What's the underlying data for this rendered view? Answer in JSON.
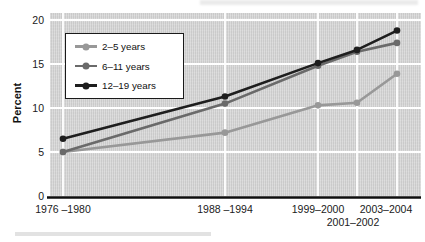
{
  "colors": {
    "plot_background": "#d4d4d4",
    "gridline": "#ffffff",
    "axis_line": "#0d0d0d",
    "text": "#1a1a1a",
    "legend_border": "#1a1a1a"
  },
  "chart_data": {
    "type": "line",
    "title": "",
    "xlabel": "",
    "ylabel": "Percent",
    "ylim": [
      0,
      20
    ],
    "yticks": [
      0,
      5,
      10,
      15,
      20
    ],
    "grid": true,
    "legend_position": "upper-left-inside",
    "categories": [
      "1976 –1980",
      "1988 –1994",
      "1999–2000",
      "2001–2002",
      "2003–2004"
    ],
    "series": [
      {
        "name": "2–5 years",
        "color": "#989898",
        "values": [
          5.0,
          7.2,
          10.3,
          10.6,
          13.9
        ]
      },
      {
        "name": "6–11 years",
        "color": "#6a6a6a",
        "values": [
          5.0,
          10.5,
          14.8,
          16.4,
          17.4
        ]
      },
      {
        "name": "12–19 years",
        "color": "#1e1e1e",
        "values": [
          6.5,
          11.3,
          15.1,
          16.6,
          18.8
        ]
      }
    ]
  }
}
